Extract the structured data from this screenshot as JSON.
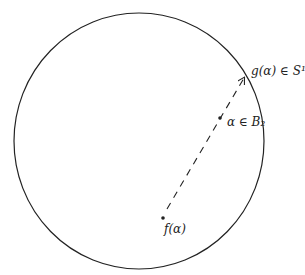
{
  "diagram": {
    "circle": {
      "label": "S^1 boundary",
      "cx": 139,
      "cy": 141,
      "rx": 125,
      "ry": 128
    },
    "points": [
      {
        "id": "f",
        "label": "f(α)",
        "x": 163,
        "y": 218
      },
      {
        "id": "alpha",
        "label": "α ∈ B₂",
        "x": 220,
        "y": 118
      },
      {
        "id": "g",
        "label": "g(α) ∈ S¹",
        "x": 245,
        "y": 76
      }
    ],
    "labels": {
      "g": "g(α) ∈ S¹",
      "alpha": "α ∈ B₂",
      "f": "f(α)"
    },
    "ray": {
      "from": "f",
      "to": "g",
      "style": "dashed",
      "arrowhead": true
    },
    "colors": {
      "stroke": "#222222",
      "background": "#ffffff"
    }
  }
}
